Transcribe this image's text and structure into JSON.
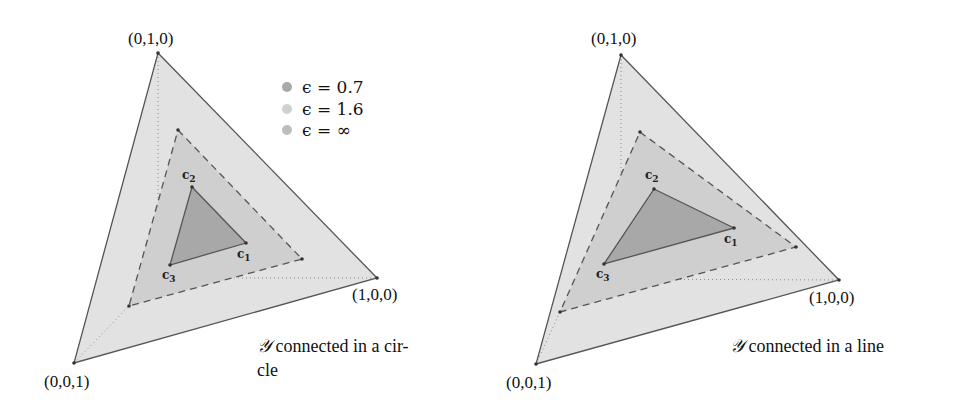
{
  "colors": {
    "outer_fill": "#e2e2e2",
    "middle_fill": "#cfcfcf",
    "inner_fill": "#a8a8a8",
    "stroke": "#555555",
    "legend_07": "#a9a9a9",
    "legend_16": "#d0d0d0",
    "legend_inf": "#bdbdbd"
  },
  "legend": {
    "items": [
      {
        "label": "ϵ = 0.7"
      },
      {
        "label": "ϵ = 1.6"
      },
      {
        "label": "ϵ = ∞"
      }
    ]
  },
  "left": {
    "vertex_top": "(0,1,0)",
    "vertex_right": "(1,0,0)",
    "vertex_bottom": "(0,0,1)",
    "c1": "c",
    "c1_sub": "1",
    "c2": "c",
    "c2_sub": "2",
    "c3": "c",
    "c3_sub": "3",
    "caption_symbol": "𝒴",
    "caption_line1": " connected in a cir-",
    "caption_line2": "cle"
  },
  "right": {
    "vertex_top": "(0,1,0)",
    "vertex_right": "(1,0,0)",
    "vertex_bottom": "(0,0,1)",
    "c1": "c",
    "c1_sub": "1",
    "c2": "c",
    "c2_sub": "2",
    "c3": "c",
    "c3_sub": "3",
    "caption_symbol": "𝒴",
    "caption_line1": " connected in a line"
  }
}
